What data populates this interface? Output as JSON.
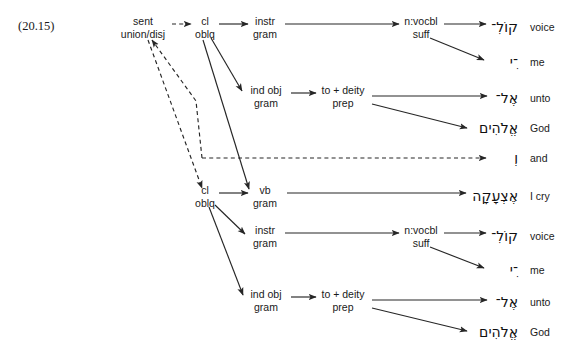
{
  "figure": {
    "example_number": "(20.15)",
    "line_color": "#262626"
  },
  "nodes": [
    {
      "id": "sent",
      "line1": "sent",
      "line2": "union/disj",
      "x": 143,
      "y": 27
    },
    {
      "id": "cl1",
      "line1": "cl",
      "line2": "oblq",
      "x": 205,
      "y": 27
    },
    {
      "id": "instr1",
      "line1": "instr",
      "line2": "gram",
      "x": 265,
      "y": 27
    },
    {
      "id": "nvocbl1",
      "line1": "n:vocbl",
      "line2": "suff",
      "x": 421,
      "y": 27
    },
    {
      "id": "indobj1",
      "line1": "ind obj",
      "line2": "gram",
      "x": 266,
      "y": 96
    },
    {
      "id": "prep1",
      "line1": "to + deity",
      "line2": "prep",
      "x": 343,
      "y": 96
    },
    {
      "id": "cl2",
      "line1": "cl",
      "line2": "oblq",
      "x": 205,
      "y": 196
    },
    {
      "id": "vb2",
      "line1": "vb",
      "line2": "gram",
      "x": 265,
      "y": 196
    },
    {
      "id": "instr2",
      "line1": "instr",
      "line2": "gram",
      "x": 265,
      "y": 236
    },
    {
      "id": "nvocbl2",
      "line1": "n:vocbl",
      "line2": "suff",
      "x": 421,
      "y": 236
    },
    {
      "id": "indobj2",
      "line1": "ind obj",
      "line2": "gram",
      "x": 266,
      "y": 300
    },
    {
      "id": "prep2",
      "line1": "to + deity",
      "line2": "prep",
      "x": 343,
      "y": 300
    }
  ],
  "terminals": [
    {
      "id": "t-voice-1",
      "hebrew": "קוֹלִ־",
      "gloss": "voice",
      "hx": 518,
      "gx": 530,
      "y": 27
    },
    {
      "id": "t-me-1",
      "hebrew": "־ִי",
      "gloss": "me",
      "hx": 518,
      "gx": 530,
      "y": 62
    },
    {
      "id": "t-unto-1",
      "hebrew": "אֶל־",
      "gloss": "unto",
      "hx": 518,
      "gx": 530,
      "y": 98
    },
    {
      "id": "t-god-1",
      "hebrew": "אֱלֹהִים",
      "gloss": "God",
      "hx": 518,
      "gx": 530,
      "y": 128
    },
    {
      "id": "t-and",
      "hebrew": "וְ",
      "gloss": "and",
      "hx": 518,
      "gx": 530,
      "y": 158
    },
    {
      "id": "t-icry",
      "hebrew": "אֶצְעָקָה",
      "gloss": "I cry",
      "hx": 518,
      "gx": 530,
      "y": 196
    },
    {
      "id": "t-voice-2",
      "hebrew": "קוֹלִ־",
      "gloss": "voice",
      "hx": 518,
      "gx": 530,
      "y": 236
    },
    {
      "id": "t-me-2",
      "hebrew": "־ִי",
      "gloss": "me",
      "hx": 518,
      "gx": 530,
      "y": 270
    },
    {
      "id": "t-unto-2",
      "hebrew": "אֶל־",
      "gloss": "unto",
      "hx": 518,
      "gx": 530,
      "y": 302
    },
    {
      "id": "t-god-2",
      "hebrew": "אֱלֹהִים",
      "gloss": "God",
      "hx": 518,
      "gx": 530,
      "y": 332
    }
  ],
  "edges": [
    {
      "id": "e-sent-cl1",
      "style": "dashed",
      "path": "M 172 24 L 191 24"
    },
    {
      "id": "e-cl1-instr1",
      "style": "solid",
      "path": "M 219 24 L 248 24"
    },
    {
      "id": "e-instr1-nvocbl1",
      "style": "solid",
      "path": "M 285 24 L 399 24"
    },
    {
      "id": "e-nvocbl1-voice1",
      "style": "solid",
      "path": "M 444 24 L 486 24"
    },
    {
      "id": "e-nvocbl1-me1",
      "style": "solid",
      "path": "M 430 38 L 484 60"
    },
    {
      "id": "e-cl1-indobj1",
      "style": "solid",
      "path": "M 211 38 L 242 91"
    },
    {
      "id": "e-indobj1-prep1",
      "style": "solid",
      "path": "M 291 93 L 316 93"
    },
    {
      "id": "e-prep1-unto1",
      "style": "solid",
      "path": "M 372 96 L 487 96"
    },
    {
      "id": "e-prep1-god1",
      "style": "solid",
      "path": "M 372 104 L 467 128"
    },
    {
      "id": "e-cl1-vb2",
      "style": "solid",
      "path": "M 203 40 L 249 189"
    },
    {
      "id": "e-sent-down-cl2",
      "style": "dashed",
      "path": "M 148 40 L 202 188"
    },
    {
      "id": "e-and-up-sent",
      "style": "dashed",
      "path": "M 202 158 L 196 101 L 152 40"
    },
    {
      "id": "e-and-horiz",
      "style": "dashed",
      "path": "M 202 158 L 486 158"
    },
    {
      "id": "e-cl2-vb2",
      "style": "solid",
      "path": "M 219 193 L 248 193"
    },
    {
      "id": "e-cl2-instr2",
      "style": "solid",
      "path": "M 215 205 L 245 234"
    },
    {
      "id": "e-vb2-icry",
      "style": "solid",
      "path": "M 287 193 L 466 193"
    },
    {
      "id": "e-instr2-nvocbl2",
      "style": "solid",
      "path": "M 285 233 L 399 233"
    },
    {
      "id": "e-nvocbl2-voice2",
      "style": "solid",
      "path": "M 444 233 L 486 233"
    },
    {
      "id": "e-nvocbl2-me2",
      "style": "solid",
      "path": "M 430 247 L 484 268"
    },
    {
      "id": "e-cl2-indobj2",
      "style": "solid",
      "path": "M 209 207 L 243 295"
    },
    {
      "id": "e-indobj2-prep2",
      "style": "solid",
      "path": "M 291 297 L 316 297"
    },
    {
      "id": "e-prep2-unto2",
      "style": "solid",
      "path": "M 372 300 L 487 300"
    },
    {
      "id": "e-prep2-god2",
      "style": "solid",
      "path": "M 372 308 L 467 331"
    }
  ]
}
